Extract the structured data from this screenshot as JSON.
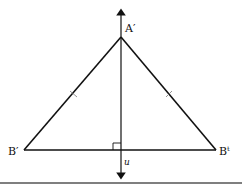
{
  "diagram": {
    "type": "isosceles triangle with perpendicular bisector",
    "labels": {
      "apex": "A′",
      "left_vertex": "B′",
      "right_vertex": "Bᵗ",
      "axis": "u"
    },
    "marks": {
      "congruent_sides": 2,
      "right_angle": true
    },
    "colors": {
      "stroke": "#111111",
      "rule": "#555555"
    }
  }
}
